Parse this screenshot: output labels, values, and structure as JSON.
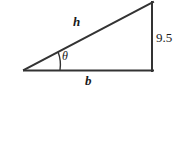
{
  "figure": {
    "type": "right-triangle-diagram",
    "background_color": "#ffffff",
    "stroke_color": "#333333",
    "labels": {
      "hypotenuse": "h",
      "angle": "θ",
      "base": "b",
      "vertical_side": "9.5"
    },
    "geometry": {
      "left_vertex": [
        24,
        70
      ],
      "apex_vertex": [
        153,
        2
      ],
      "right_angle_vertex": [
        153,
        70
      ],
      "angle_arc_radius": 36
    }
  }
}
